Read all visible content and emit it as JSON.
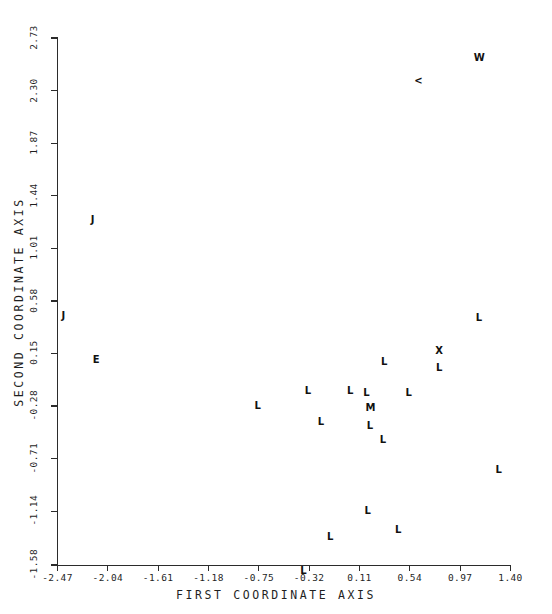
{
  "chart_data": {
    "type": "scatter",
    "title": "",
    "xlabel": "FIRST COORDINATE AXIS",
    "ylabel": "SECOND COORDINATE AXIS",
    "xlim": [
      -2.47,
      1.4
    ],
    "ylim": [
      -1.58,
      2.73
    ],
    "grid": false,
    "legend": null,
    "xticks": [
      "-2.47",
      "-2.04",
      "-1.61",
      "-1.18",
      "-0.75",
      "-0.32",
      "0.11",
      "0.54",
      "0.97",
      "1.40"
    ],
    "xtick_values": [
      -2.47,
      -2.04,
      -1.61,
      -1.18,
      -0.75,
      -0.32,
      0.11,
      0.54,
      0.97,
      1.4
    ],
    "yticks": [
      "2.73",
      "2.30",
      "1.87",
      "1.44",
      "1.01",
      "0.58",
      "0.15",
      "-0.28",
      "-0.71",
      "-1.14",
      "-1.58"
    ],
    "ytick_values": [
      2.73,
      2.3,
      1.87,
      1.44,
      1.01,
      0.58,
      0.15,
      -0.28,
      -0.71,
      -1.14,
      -1.58
    ],
    "marker_style": "text-label",
    "points": [
      {
        "label": "W",
        "x": 1.12,
        "y": 2.57,
        "overlap": true
      },
      {
        "label": "<",
        "x": 0.6,
        "y": 2.38,
        "overlap": true
      },
      {
        "label": "J",
        "x": -2.17,
        "y": 1.24,
        "overlap": false
      },
      {
        "label": "J",
        "x": -2.42,
        "y": 0.46,
        "overlap": false
      },
      {
        "label": "L",
        "x": 1.13,
        "y": 0.44,
        "overlap": false
      },
      {
        "label": "E",
        "x": -2.14,
        "y": 0.1,
        "overlap": false
      },
      {
        "label": "X",
        "x": 0.79,
        "y": 0.17,
        "overlap": false
      },
      {
        "label": "L",
        "x": 0.79,
        "y": 0.03,
        "overlap": false
      },
      {
        "label": "L",
        "x": 0.32,
        "y": 0.08,
        "overlap": false
      },
      {
        "label": "L",
        "x": -0.33,
        "y": -0.16,
        "overlap": false
      },
      {
        "label": "L",
        "x": 0.03,
        "y": -0.16,
        "overlap": false
      },
      {
        "label": "L",
        "x": 0.17,
        "y": -0.17,
        "overlap": false
      },
      {
        "label": "L",
        "x": 0.53,
        "y": -0.17,
        "overlap": false
      },
      {
        "label": "L",
        "x": -0.76,
        "y": -0.28,
        "overlap": false
      },
      {
        "label": "M",
        "x": 0.19,
        "y": -0.3,
        "overlap": true
      },
      {
        "label": "L",
        "x": -0.22,
        "y": -0.41,
        "overlap": false
      },
      {
        "label": "L",
        "x": 0.2,
        "y": -0.44,
        "overlap": false
      },
      {
        "label": "L",
        "x": 0.31,
        "y": -0.56,
        "overlap": false
      },
      {
        "label": "L",
        "x": 1.3,
        "y": -0.8,
        "overlap": false
      },
      {
        "label": "L",
        "x": 0.18,
        "y": -1.14,
        "overlap": false
      },
      {
        "label": "L",
        "x": 0.44,
        "y": -1.29,
        "overlap": false
      },
      {
        "label": "L",
        "x": -0.14,
        "y": -1.35,
        "overlap": false
      },
      {
        "label": "L",
        "x": -0.37,
        "y": -1.63,
        "overlap": false
      }
    ]
  },
  "plot_geometry": {
    "x_px_min": 57.5,
    "x_px_max": 510.5,
    "y_px_min": 38.0,
    "y_px_max": 565.0
  },
  "colors": {
    "axis": "#2b2b2b",
    "text": "#1f1f1f",
    "marker": "#111111",
    "background": "#ffffff"
  }
}
